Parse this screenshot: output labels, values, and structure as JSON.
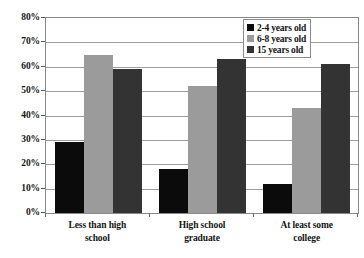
{
  "chart_data": {
    "type": "bar",
    "title": "",
    "subtitle": "",
    "xlabel": "",
    "ylabel": "",
    "categories": [
      "Less than high school",
      "High school graduate",
      "At least some college"
    ],
    "category_lines": [
      [
        "Less than high",
        "school"
      ],
      [
        "High school",
        "graduate"
      ],
      [
        "At least some",
        "college"
      ]
    ],
    "series": [
      {
        "name": "2-4 years old",
        "color": "#0b0b0b",
        "values": [
          29,
          18,
          12
        ]
      },
      {
        "name": "6-8 years old",
        "color": "#9b9b9b",
        "values": [
          65,
          52,
          43
        ]
      },
      {
        "name": "15 years old",
        "color": "#333333",
        "values": [
          59,
          63,
          61
        ]
      }
    ],
    "ylim": [
      0,
      80
    ],
    "ytick_values": [
      0,
      10,
      20,
      30,
      40,
      50,
      60,
      70,
      80
    ],
    "ytick_labels": [
      "0%",
      "10%",
      "20%",
      "30%",
      "40%",
      "50%",
      "60%",
      "70%",
      "80%"
    ],
    "grid": true,
    "grid_axis": "y",
    "legend_position": "top-right",
    "value_suffix": "%"
  }
}
